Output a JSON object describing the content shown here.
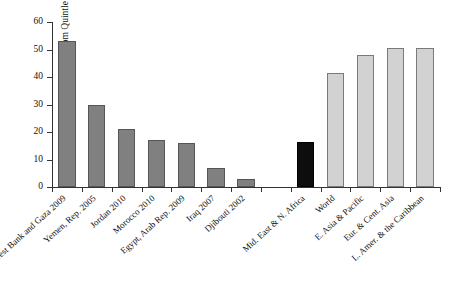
{
  "chart_data": {
    "type": "bar",
    "title": "",
    "subtitle": "",
    "xlabel": "",
    "ylabel": "Percentage Covered in Bottom Quintle",
    "ylim": [
      0,
      60
    ],
    "yticks": [
      0,
      10,
      20,
      30,
      40,
      50,
      60
    ],
    "ytick_labels": [
      "0",
      "10",
      "20",
      "30",
      "40",
      "50",
      "60"
    ],
    "grid": false,
    "legend": "none",
    "categories": [
      "West Bank and Gaza 2009",
      "Yemen, Rep. 2005",
      "Jordan 2010",
      "Morocco 2010",
      "Egypt, Arab Rep. 2009",
      "Iraq 2007",
      "Djibouti 2002",
      "Mid. East & N. Africa",
      "World",
      "E. Asia & Pacific",
      "Eur. & Cent. Asia",
      "L. Amer. & the Caribbean"
    ],
    "values": [
      53,
      30,
      21,
      17,
      16,
      7,
      3,
      16.5,
      41.5,
      48,
      50.5,
      50.5
    ],
    "bar_colors": [
      "#808080",
      "#808080",
      "#808080",
      "#808080",
      "#808080",
      "#808080",
      "#808080",
      "#0d0d0d",
      "#d2d2d2",
      "#d2d2d2",
      "#d2d2d2",
      "#d2d2d2"
    ],
    "bar_groups": [
      "country",
      "country",
      "country",
      "country",
      "country",
      "country",
      "country",
      "region-mena",
      "region-comparison",
      "region-comparison",
      "region-comparison",
      "region-comparison"
    ],
    "annotations": [
      "Gap separates individual MENA economies (dark gray) from regional aggregates (black = Mid. East & N. Africa, light gray = comparison regions)."
    ]
  },
  "colors": {
    "country_bar": "#808080",
    "mena_bar": "#0d0d0d",
    "region_bar": "#d2d2d2",
    "axis": "#333333",
    "text": "#111111",
    "background": "#ffffff"
  }
}
